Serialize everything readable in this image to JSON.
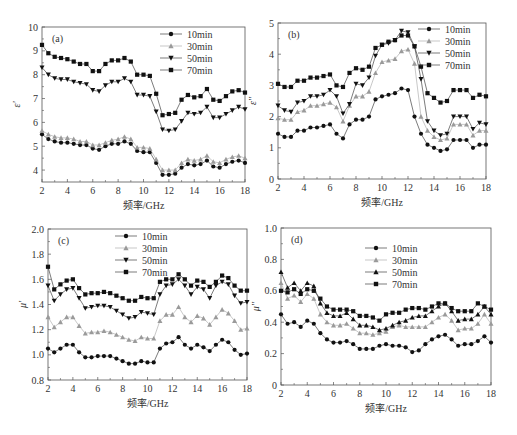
{
  "figure": {
    "x_label": "频率/GHz",
    "legend_labels": [
      "10min",
      "30min",
      "50min",
      "70min"
    ]
  },
  "chart_data": [
    {
      "type": "line",
      "panel_label": "(a)",
      "ylabel": "ε'",
      "xlabel": "频率/GHz",
      "xlim": [
        2,
        18
      ],
      "ylim": [
        3.5,
        10
      ],
      "xticks": [
        2,
        4,
        6,
        8,
        10,
        12,
        14,
        16,
        18
      ],
      "yticks": [
        4,
        5,
        6,
        7,
        8,
        9,
        10
      ],
      "frame": {
        "x0": 42,
        "y0": 27,
        "x1": 245,
        "y1": 182
      },
      "legend": {
        "x": 160,
        "y": 34,
        "position": "top-right"
      },
      "x": [
        2,
        2.5,
        3,
        3.5,
        4,
        4.5,
        5,
        5.5,
        6,
        6.5,
        7,
        7.5,
        8,
        8.5,
        9,
        9.5,
        10,
        10.5,
        11,
        11.5,
        12,
        12.5,
        13,
        13.5,
        14,
        14.5,
        15,
        15.5,
        16,
        16.5,
        17,
        17.5,
        18
      ],
      "series": [
        {
          "name": "10min",
          "marker": "circle",
          "color": "#111111",
          "values": [
            5.5,
            5.3,
            5.2,
            5.15,
            5.15,
            5.1,
            5.05,
            5.05,
            4.9,
            4.85,
            5.0,
            5.1,
            5.1,
            5.2,
            5.1,
            4.8,
            4.75,
            4.75,
            4.3,
            3.8,
            3.8,
            3.85,
            4.1,
            4.25,
            4.2,
            4.25,
            4.4,
            4.15,
            4.1,
            4.25,
            4.35,
            4.4,
            4.3
          ]
        },
        {
          "name": "30min",
          "marker": "triangle-up",
          "color": "#9a9a9a",
          "values": [
            5.65,
            5.5,
            5.4,
            5.35,
            5.35,
            5.3,
            5.2,
            5.2,
            5.05,
            5.05,
            5.15,
            5.25,
            5.3,
            5.4,
            5.3,
            4.95,
            4.95,
            4.9,
            4.45,
            4.0,
            4.0,
            4.0,
            4.3,
            4.45,
            4.4,
            4.45,
            4.6,
            4.35,
            4.3,
            4.45,
            4.55,
            4.6,
            4.5
          ]
        },
        {
          "name": "50min",
          "marker": "triangle-down",
          "color": "#111111",
          "values": [
            8.3,
            8.0,
            7.85,
            7.8,
            7.8,
            7.7,
            7.65,
            7.6,
            7.35,
            7.3,
            7.55,
            7.7,
            7.7,
            7.85,
            7.7,
            7.15,
            7.15,
            7.1,
            6.45,
            5.7,
            5.65,
            5.7,
            6.05,
            6.4,
            6.35,
            6.4,
            6.65,
            6.2,
            6.2,
            6.35,
            6.5,
            6.65,
            6.55
          ]
        },
        {
          "name": "70min",
          "marker": "square",
          "color": "#111111",
          "values": [
            9.25,
            8.9,
            8.75,
            8.7,
            8.65,
            8.55,
            8.45,
            8.45,
            8.15,
            8.15,
            8.45,
            8.6,
            8.6,
            8.7,
            8.55,
            8.0,
            8.0,
            7.95,
            7.2,
            6.3,
            6.35,
            6.4,
            6.95,
            7.15,
            7.05,
            7.1,
            7.4,
            6.95,
            6.9,
            7.1,
            7.3,
            7.35,
            7.25
          ]
        }
      ]
    },
    {
      "type": "line",
      "panel_label": "(b)",
      "ylabel": "ε''",
      "xlabel": "频率/GHz",
      "xlim": [
        2,
        18
      ],
      "ylim": [
        0,
        5
      ],
      "xticks": [
        2,
        4,
        6,
        8,
        10,
        12,
        14,
        16,
        18
      ],
      "yticks": [
        0,
        1,
        2,
        3,
        4,
        5
      ],
      "frame": {
        "x0": 278,
        "y0": 23,
        "x1": 486,
        "y1": 179
      },
      "legend": {
        "x": 418,
        "y": 29,
        "position": "top-right"
      },
      "x": [
        2,
        2.5,
        3,
        3.5,
        4,
        4.5,
        5,
        5.5,
        6,
        6.5,
        7,
        7.5,
        8,
        8.5,
        9,
        9.5,
        10,
        10.5,
        11,
        11.5,
        12,
        12.5,
        13,
        13.5,
        14,
        14.5,
        15,
        15.5,
        16,
        16.5,
        17,
        17.5,
        18
      ],
      "series": [
        {
          "name": "10min",
          "marker": "circle",
          "color": "#111111",
          "values": [
            1.45,
            1.35,
            1.35,
            1.55,
            1.55,
            1.65,
            1.65,
            1.7,
            1.75,
            1.45,
            1.3,
            1.75,
            1.9,
            1.9,
            2.0,
            2.55,
            2.65,
            2.7,
            2.75,
            2.9,
            2.85,
            2.0,
            1.45,
            1.1,
            1.0,
            0.9,
            0.95,
            1.25,
            1.25,
            1.25,
            1.0,
            1.1,
            1.1
          ]
        },
        {
          "name": "30min",
          "marker": "triangle-up",
          "color": "#9a9a9a",
          "values": [
            1.95,
            1.9,
            1.9,
            2.15,
            2.2,
            2.35,
            2.35,
            2.4,
            2.45,
            2.3,
            1.85,
            2.35,
            2.65,
            2.65,
            2.8,
            3.4,
            3.75,
            3.8,
            3.85,
            4.1,
            4.15,
            3.7,
            2.0,
            1.55,
            1.35,
            1.25,
            1.3,
            1.75,
            1.75,
            1.75,
            1.4,
            1.55,
            1.55
          ]
        },
        {
          "name": "50min",
          "marker": "triangle-down",
          "color": "#111111",
          "values": [
            2.35,
            2.2,
            2.15,
            2.45,
            2.5,
            2.65,
            2.65,
            2.7,
            2.85,
            2.65,
            2.1,
            2.4,
            3.05,
            3.0,
            3.25,
            3.95,
            4.3,
            4.35,
            4.45,
            4.75,
            4.7,
            4.25,
            3.2,
            1.85,
            1.55,
            1.4,
            1.45,
            2.0,
            2.0,
            2.0,
            1.6,
            1.8,
            1.75
          ]
        },
        {
          "name": "70min",
          "marker": "square",
          "color": "#111111",
          "values": [
            3.05,
            2.95,
            2.95,
            3.15,
            3.15,
            3.25,
            3.25,
            3.3,
            3.35,
            3.0,
            2.95,
            3.4,
            3.55,
            3.5,
            3.6,
            4.2,
            4.3,
            4.4,
            4.45,
            4.6,
            4.6,
            4.25,
            3.6,
            2.75,
            2.6,
            2.45,
            2.5,
            2.85,
            2.85,
            2.85,
            2.6,
            2.7,
            2.65
          ]
        }
      ]
    },
    {
      "type": "line",
      "panel_label": "(c)",
      "ylabel": "μ'",
      "xlabel": "频率/GHz",
      "xlim": [
        2,
        18
      ],
      "ylim": [
        0.8,
        2.0
      ],
      "xticks": [
        2,
        4,
        6,
        8,
        10,
        12,
        14,
        16,
        18
      ],
      "yticks": [
        0.8,
        1.0,
        1.2,
        1.4,
        1.6,
        1.8,
        2.0
      ],
      "frame": {
        "x0": 48,
        "y0": 229,
        "x1": 247,
        "y1": 380
      },
      "legend": {
        "x": 115,
        "y": 236,
        "position": "top-center"
      },
      "x": [
        2,
        2.5,
        3,
        3.5,
        4,
        4.5,
        5,
        5.5,
        6,
        6.5,
        7,
        7.5,
        8,
        8.5,
        9,
        9.5,
        10,
        10.5,
        11,
        11.5,
        12,
        12.5,
        13,
        13.5,
        14,
        14.5,
        15,
        15.5,
        16,
        16.5,
        17,
        17.5,
        18
      ],
      "series": [
        {
          "name": "10min",
          "marker": "circle",
          "color": "#111111",
          "values": [
            1.05,
            1.02,
            1.05,
            1.08,
            1.08,
            1.02,
            0.98,
            0.98,
            0.99,
            0.99,
            0.99,
            0.97,
            0.95,
            0.93,
            0.93,
            0.95,
            0.94,
            0.94,
            1.05,
            1.09,
            1.1,
            1.14,
            1.08,
            1.05,
            1.08,
            1.06,
            1.03,
            1.08,
            1.12,
            1.1,
            1.04,
            1.0,
            1.01
          ]
        },
        {
          "name": "30min",
          "marker": "triangle-up",
          "color": "#9a9a9a",
          "values": [
            1.3,
            1.22,
            1.26,
            1.3,
            1.3,
            1.23,
            1.17,
            1.18,
            1.18,
            1.19,
            1.18,
            1.16,
            1.14,
            1.12,
            1.11,
            1.14,
            1.13,
            1.13,
            1.27,
            1.32,
            1.32,
            1.38,
            1.3,
            1.26,
            1.31,
            1.29,
            1.24,
            1.3,
            1.36,
            1.33,
            1.27,
            1.2,
            1.21
          ]
        },
        {
          "name": "50min",
          "marker": "triangle-down",
          "color": "#111111",
          "values": [
            1.55,
            1.43,
            1.48,
            1.52,
            1.53,
            1.45,
            1.37,
            1.38,
            1.39,
            1.39,
            1.38,
            1.35,
            1.32,
            1.29,
            1.3,
            1.34,
            1.33,
            1.32,
            1.48,
            1.55,
            1.56,
            1.6,
            1.55,
            1.48,
            1.54,
            1.52,
            1.45,
            1.55,
            1.58,
            1.56,
            1.47,
            1.41,
            1.42
          ]
        },
        {
          "name": "70min",
          "marker": "square",
          "color": "#111111",
          "values": [
            1.7,
            1.52,
            1.56,
            1.59,
            1.6,
            1.53,
            1.48,
            1.49,
            1.49,
            1.5,
            1.49,
            1.47,
            1.45,
            1.43,
            1.43,
            1.46,
            1.45,
            1.45,
            1.58,
            1.6,
            1.6,
            1.64,
            1.6,
            1.55,
            1.59,
            1.58,
            1.54,
            1.58,
            1.63,
            1.61,
            1.55,
            1.51,
            1.51
          ]
        }
      ]
    },
    {
      "type": "line",
      "panel_label": "(d)",
      "ylabel": "μ''",
      "xlabel": "频率/GHz",
      "xlim": [
        2,
        18
      ],
      "ylim": [
        0,
        1.0
      ],
      "xticks": [
        2,
        4,
        6,
        8,
        10,
        12,
        14,
        16,
        18
      ],
      "yticks": [
        0,
        0.2,
        0.4,
        0.6,
        0.8,
        1.0
      ],
      "frame": {
        "x0": 281,
        "y0": 228,
        "x1": 491,
        "y1": 385
      },
      "legend": {
        "x": 365,
        "y": 248,
        "position": "top-center"
      },
      "x": [
        2,
        2.5,
        3,
        3.5,
        4,
        4.5,
        5,
        5.5,
        6,
        6.5,
        7,
        7.5,
        8,
        8.5,
        9,
        9.5,
        10,
        10.5,
        11,
        11.5,
        12,
        12.5,
        13,
        13.5,
        14,
        14.5,
        15,
        15.5,
        16,
        16.5,
        17,
        17.5,
        18
      ],
      "series": [
        {
          "name": "10min",
          "marker": "circle",
          "color": "#111111",
          "values": [
            0.45,
            0.39,
            0.4,
            0.37,
            0.41,
            0.39,
            0.33,
            0.29,
            0.27,
            0.27,
            0.28,
            0.26,
            0.23,
            0.23,
            0.23,
            0.25,
            0.26,
            0.25,
            0.25,
            0.24,
            0.21,
            0.22,
            0.26,
            0.29,
            0.31,
            0.32,
            0.29,
            0.25,
            0.26,
            0.26,
            0.28,
            0.31,
            0.27
          ]
        },
        {
          "name": "30min",
          "marker": "triangle-up",
          "color": "#9a9a9a",
          "values": [
            0.65,
            0.55,
            0.57,
            0.53,
            0.58,
            0.55,
            0.45,
            0.4,
            0.38,
            0.38,
            0.39,
            0.36,
            0.33,
            0.33,
            0.32,
            0.33,
            0.34,
            0.37,
            0.38,
            0.37,
            0.37,
            0.37,
            0.37,
            0.4,
            0.43,
            0.45,
            0.41,
            0.35,
            0.36,
            0.36,
            0.39,
            0.45,
            0.39
          ]
        },
        {
          "name": "50min",
          "marker": "triangle-up-filled",
          "color": "#111111",
          "values": [
            0.72,
            0.62,
            0.65,
            0.6,
            0.65,
            0.63,
            0.52,
            0.46,
            0.44,
            0.44,
            0.46,
            0.42,
            0.38,
            0.38,
            0.37,
            0.35,
            0.36,
            0.38,
            0.4,
            0.41,
            0.43,
            0.44,
            0.44,
            0.47,
            0.5,
            0.52,
            0.47,
            0.41,
            0.42,
            0.42,
            0.45,
            0.5,
            0.45
          ]
        },
        {
          "name": "70min",
          "marker": "square",
          "color": "#111111",
          "values": [
            0.6,
            0.59,
            0.61,
            0.58,
            0.61,
            0.6,
            0.55,
            0.5,
            0.48,
            0.48,
            0.48,
            0.47,
            0.44,
            0.44,
            0.43,
            0.41,
            0.45,
            0.46,
            0.46,
            0.48,
            0.49,
            0.49,
            0.48,
            0.5,
            0.52,
            0.52,
            0.49,
            0.47,
            0.47,
            0.47,
            0.52,
            0.5,
            0.48
          ]
        }
      ]
    }
  ]
}
